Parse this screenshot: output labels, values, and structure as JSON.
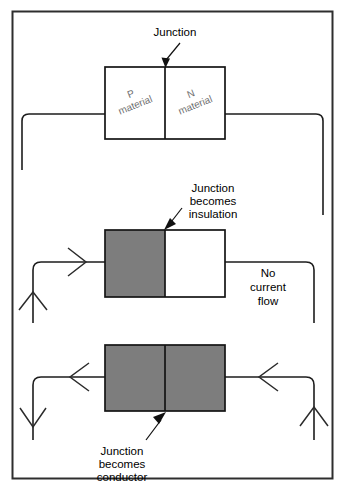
{
  "figure": {
    "background_color": "#ffffff",
    "frame_color": "#2e2e2e",
    "semiconductor_fill": "#7d7d7d",
    "insulator_fill": "#ffffff",
    "wire_color": "#1d1d1d",
    "material_label_color": "#6e6e6e"
  },
  "panels": [
    {
      "id": "unbiased",
      "callout": "Junction",
      "left_block_label_line1": "P",
      "left_block_label_line2": "material",
      "right_block_label_line1": "N",
      "right_block_label_line2": "material",
      "left_block_state": "white",
      "right_block_state": "white"
    },
    {
      "id": "reverse-biased",
      "callout_line1": "Junction",
      "callout_line2": "becomes",
      "callout_line3": "insulation",
      "note_line1": "No",
      "note_line2": "current",
      "note_line3": "flow",
      "left_block_state": "gray",
      "right_block_state": "white",
      "current_direction": "no-flow"
    },
    {
      "id": "forward-biased",
      "callout_line1": "Junction",
      "callout_line2": "becomes",
      "callout_line3": "conductor",
      "left_block_state": "gray",
      "right_block_state": "gray",
      "current_direction": "flowing"
    }
  ]
}
